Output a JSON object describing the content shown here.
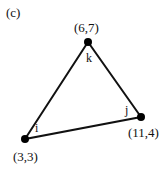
{
  "figure": {
    "panel_label": "(c)",
    "nodes": [
      {
        "id": "i",
        "name": "i",
        "coord_label": "(3,3)",
        "x": 25,
        "y": 139
      },
      {
        "id": "j",
        "name": "j",
        "coord_label": "(11,4)",
        "x": 141,
        "y": 117
      },
      {
        "id": "k",
        "name": "k",
        "coord_label": "(6,7)",
        "x": 88,
        "y": 42
      }
    ],
    "edges": [
      [
        "i",
        "k"
      ],
      [
        "k",
        "j"
      ],
      [
        "j",
        "i"
      ]
    ],
    "colors": {
      "line": "#111111",
      "node": "#000000",
      "background": "#ffffff"
    }
  }
}
